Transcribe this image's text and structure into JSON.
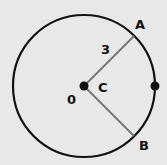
{
  "diagram": {
    "type": "circle-with-radii",
    "center": {
      "label": "C",
      "x": 84,
      "y": 86
    },
    "radius": 71,
    "circle_color": "#111111",
    "radius_line_color": "#777777",
    "points": [
      {
        "label": "A",
        "x": 134,
        "y": 36
      },
      {
        "label": "B",
        "x": 134,
        "y": 136
      }
    ],
    "right_point": {
      "x": 155,
      "y": 86
    },
    "radius_label": "3",
    "angle_label": "0",
    "labels": {
      "A": "A",
      "B": "B",
      "C": "C",
      "radius": "3",
      "angle": "0"
    }
  }
}
